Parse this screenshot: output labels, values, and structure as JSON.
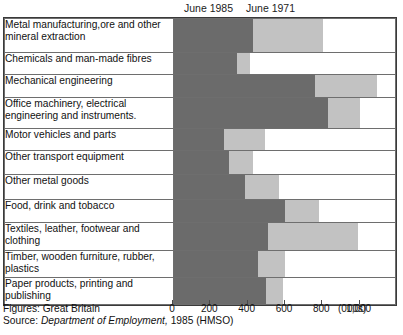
{
  "legend": {
    "series": [
      {
        "key": "june1985",
        "label": "June 1985",
        "color": "#6b6b6b"
      },
      {
        "key": "june1971",
        "label": "June 1971",
        "color": "#c2c2c2"
      }
    ]
  },
  "axis": {
    "unit_label": "(000s)",
    "ticks": [
      "0",
      "200",
      "400",
      "600",
      "800",
      "1,000"
    ]
  },
  "footer": {
    "figures_label": "Figures:",
    "figures_value": "Great Britain",
    "source_label": "Source:",
    "source_italic": "Department of Employment,",
    "source_rest": "1985 (HMSO)"
  },
  "chart_data": {
    "type": "bar",
    "orientation": "horizontal",
    "stacked": false,
    "note": "Each row shows June 1985 (dark) then June 1971 (light) drawn end-to-end; light segment length is the 1971 value.",
    "title": "",
    "xlabel": "(000s)",
    "ylabel": "",
    "xlim": [
      0,
      1200
    ],
    "xticks": [
      0,
      200,
      400,
      600,
      800,
      1000
    ],
    "grid": false,
    "legend_position": "top",
    "categories": [
      "Metal manufacturing,ore and other mineral extraction",
      "Chemicals and man-made fibres",
      "Mechanical engineering",
      "Office machinery, electrical engineering and instruments.",
      "Motor vehicles and parts",
      "Other transport equipment",
      "Other metal goods",
      "Food, drink and tobacco",
      "Textiles, leather, footwear and clothing",
      "Timber, wooden furniture, rubber, plastics",
      "Paper products, printing and publishing"
    ],
    "series": [
      {
        "name": "June 1985",
        "color": "#6b6b6b",
        "values": [
          425,
          337,
          756,
          825,
          269,
          294,
          381,
          594,
          506,
          450,
          494
        ]
      },
      {
        "name": "June 1971",
        "color": "#c2c2c2",
        "values": [
          375,
          69,
          331,
          169,
          219,
          131,
          181,
          181,
          481,
          144,
          88
        ]
      }
    ],
    "rows": [
      {
        "label": "Metal manufacturing,ore and other mineral extraction",
        "june1985": 425,
        "june1971": 375,
        "height": 34
      },
      {
        "label": "Chemicals and man-made fibres",
        "june1985": 337,
        "june1971": 69,
        "height": 22
      },
      {
        "label": "Mechanical engineering",
        "june1985": 756,
        "june1971": 331,
        "height": 23
      },
      {
        "label": "Office machinery, electrical engineering and instruments.",
        "june1985": 825,
        "june1971": 169,
        "height": 31
      },
      {
        "label": "Motor vehicles and parts",
        "june1985": 269,
        "june1971": 219,
        "height": 22
      },
      {
        "label": "Other transport equipment",
        "june1985": 294,
        "june1971": 131,
        "height": 24
      },
      {
        "label": "Other metal goods",
        "june1985": 381,
        "june1971": 181,
        "height": 25
      },
      {
        "label": "Food, drink and tobacco",
        "june1985": 594,
        "june1971": 181,
        "height": 23
      },
      {
        "label": "Textiles, leather, footwear and clothing",
        "june1985": 506,
        "june1971": 481,
        "height": 28
      },
      {
        "label": "Timber, wooden furniture, rubber, plastics",
        "june1985": 450,
        "june1971": 144,
        "height": 27
      },
      {
        "label": "Paper products, printing and publishing",
        "june1985": 494,
        "june1971": 88,
        "height": 27
      }
    ]
  }
}
